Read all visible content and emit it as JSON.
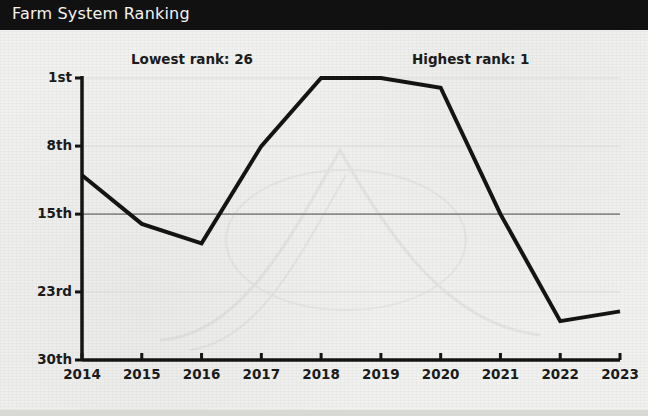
{
  "header": {
    "title": "Farm System Ranking",
    "bar_color": "#111111",
    "text_color": "#f4f4f2"
  },
  "annotations": {
    "lowest": "Lowest rank: 26",
    "highest": "Highest rank: 1"
  },
  "chart_data": {
    "type": "line",
    "title": "Farm System Ranking",
    "xlabel": "",
    "ylabel": "",
    "x": [
      2014,
      2015,
      2016,
      2017,
      2018,
      2019,
      2020,
      2021,
      2022,
      2023
    ],
    "categories": [
      "2014",
      "2015",
      "2016",
      "2017",
      "2018",
      "2019",
      "2020",
      "2021",
      "2022",
      "2023"
    ],
    "values": [
      11,
      16,
      18,
      8,
      1,
      1,
      2,
      15,
      26,
      25
    ],
    "series": [
      {
        "name": "Farm System Ranking",
        "values": [
          11,
          16,
          18,
          8,
          1,
          1,
          2,
          15,
          26,
          25
        ],
        "color": "#141414"
      }
    ],
    "y_tick_values": [
      1,
      8,
      15,
      23,
      30
    ],
    "y_tick_labels": [
      "1st",
      "8th",
      "15th",
      "23rd",
      "30th"
    ],
    "x_tick_labels": [
      "2014",
      "2015",
      "2016",
      "2017",
      "2018",
      "2019",
      "2020",
      "2021",
      "2022",
      "2023"
    ],
    "ylim": [
      1,
      30
    ],
    "xlim": [
      2014,
      2023
    ],
    "y_inverted": true,
    "grid": true,
    "grid_color": "#dcdcda",
    "emphasis_gridline": 15,
    "emphasis_gridline_color": "#8a8a88",
    "legend": "none",
    "line_width": 4,
    "background_color": "#f1f1ef",
    "axis_color": "#141414",
    "annotations": [
      {
        "text": "Lowest rank: 26",
        "refers_to_year": 2022,
        "refers_to_value": 26
      },
      {
        "text": "Highest rank: 1",
        "refers_to_year": 2018,
        "refers_to_value": 1
      }
    ]
  }
}
